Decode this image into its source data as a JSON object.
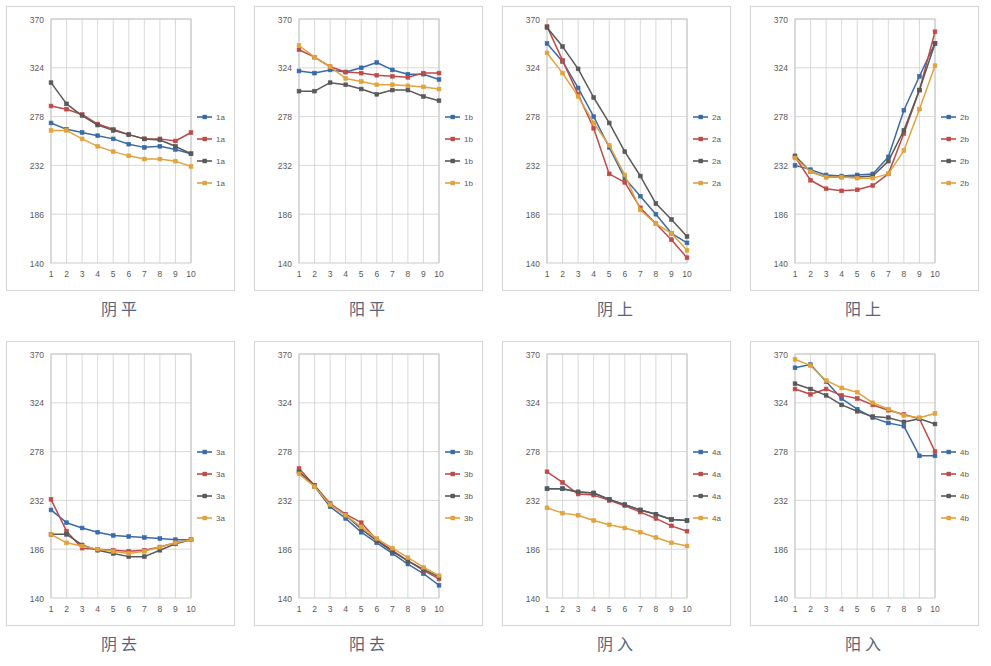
{
  "figure": {
    "panel_count": 8,
    "axis": {
      "y_ticks": [
        140,
        186,
        232,
        278,
        324,
        370
      ],
      "y_min": 140,
      "y_max": 370,
      "x_ticks": [
        1,
        2,
        3,
        4,
        5,
        6,
        7,
        8,
        9,
        10
      ],
      "x_min": 1,
      "x_max": 10,
      "grid": "vertical-and-horizontal"
    },
    "colors": {
      "series1": "#3A6BA5",
      "series2": "#BE4B48",
      "series3": "#595959",
      "series4": "#E0A33E",
      "grid": "#c9c9c9",
      "frame": "#bfbfbf",
      "tick_text": "#595959",
      "caption_text": "#59637a"
    },
    "legend_position": "right"
  },
  "chart_data": [
    {
      "id": "yinping",
      "type": "line",
      "title": "阴平",
      "xlabel": "",
      "ylabel": "",
      "x": [
        1,
        2,
        3,
        4,
        5,
        6,
        7,
        8,
        9,
        10
      ],
      "ylim": [
        140,
        370
      ],
      "legend": [
        "1a",
        "1a",
        "1a",
        "1a"
      ],
      "series": [
        {
          "name": "1a",
          "color": "#3A6BA5",
          "values": [
            272,
            266,
            263,
            260,
            257,
            252,
            249,
            250,
            247,
            243
          ]
        },
        {
          "name": "1a",
          "color": "#BE4B48",
          "values": [
            288,
            285,
            280,
            271,
            266,
            261,
            257,
            257,
            255,
            263
          ]
        },
        {
          "name": "1a",
          "color": "#595959",
          "values": [
            310,
            290,
            279,
            270,
            265,
            261,
            257,
            256,
            250,
            243
          ]
        },
        {
          "name": "1a",
          "color": "#E0A33E",
          "values": [
            265,
            265,
            257,
            250,
            245,
            241,
            238,
            238,
            236,
            231
          ]
        }
      ]
    },
    {
      "id": "yangping",
      "type": "line",
      "title": "阳平",
      "xlabel": "",
      "ylabel": "",
      "x": [
        1,
        2,
        3,
        4,
        5,
        6,
        7,
        8,
        9,
        10
      ],
      "ylim": [
        140,
        370
      ],
      "legend": [
        "1b",
        "1b",
        "1b",
        "1b"
      ],
      "series": [
        {
          "name": "1b",
          "color": "#3A6BA5",
          "values": [
            321,
            319,
            322,
            320,
            324,
            329,
            322,
            318,
            318,
            313
          ]
        },
        {
          "name": "1b",
          "color": "#BE4B48",
          "values": [
            341,
            334,
            325,
            320,
            319,
            317,
            316,
            315,
            319,
            319
          ]
        },
        {
          "name": "1b",
          "color": "#595959",
          "values": [
            302,
            302,
            310,
            308,
            304,
            299,
            303,
            303,
            297,
            293
          ]
        },
        {
          "name": "1b",
          "color": "#E0A33E",
          "values": [
            345,
            334,
            325,
            314,
            311,
            308,
            308,
            307,
            306,
            304
          ]
        }
      ]
    },
    {
      "id": "yinshang",
      "type": "line",
      "title": "阴上",
      "xlabel": "",
      "ylabel": "",
      "x": [
        1,
        2,
        3,
        4,
        5,
        6,
        7,
        8,
        9,
        10
      ],
      "ylim": [
        140,
        370
      ],
      "legend": [
        "2a",
        "2a",
        "2a",
        "2a"
      ],
      "series": [
        {
          "name": "2a",
          "color": "#3A6BA5",
          "values": [
            347,
            330,
            305,
            278,
            249,
            220,
            203,
            186,
            168,
            159
          ]
        },
        {
          "name": "2a",
          "color": "#BE4B48",
          "values": [
            363,
            331,
            299,
            267,
            224,
            216,
            192,
            177,
            162,
            145
          ]
        },
        {
          "name": "2a",
          "color": "#595959",
          "values": [
            362,
            344,
            323,
            296,
            272,
            245,
            222,
            196,
            181,
            165
          ]
        },
        {
          "name": "2a",
          "color": "#E0A33E",
          "values": [
            338,
            319,
            297,
            272,
            251,
            223,
            190,
            177,
            168,
            152
          ]
        }
      ]
    },
    {
      "id": "yangshang",
      "type": "line",
      "title": "阳上",
      "xlabel": "",
      "ylabel": "",
      "x": [
        1,
        2,
        3,
        4,
        5,
        6,
        7,
        8,
        9,
        10
      ],
      "ylim": [
        140,
        370
      ],
      "legend": [
        "2b",
        "2b",
        "2b",
        "2b"
      ],
      "series": [
        {
          "name": "2b",
          "color": "#3A6BA5",
          "values": [
            232,
            228,
            223,
            222,
            223,
            224,
            240,
            284,
            316,
            347
          ]
        },
        {
          "name": "2b",
          "color": "#BE4B48",
          "values": [
            240,
            218,
            210,
            208,
            209,
            213,
            224,
            262,
            303,
            358
          ]
        },
        {
          "name": "2b",
          "color": "#595959",
          "values": [
            241,
            226,
            221,
            221,
            221,
            222,
            236,
            265,
            303,
            347
          ]
        },
        {
          "name": "2b",
          "color": "#E0A33E",
          "values": [
            239,
            226,
            221,
            221,
            220,
            220,
            224,
            246,
            285,
            326
          ]
        }
      ]
    },
    {
      "id": "yinqu",
      "type": "line",
      "title": "阴去",
      "xlabel": "",
      "ylabel": "",
      "x": [
        1,
        2,
        3,
        4,
        5,
        6,
        7,
        8,
        9,
        10
      ],
      "ylim": [
        140,
        370
      ],
      "legend": [
        "3a",
        "3a",
        "3a",
        "3a"
      ],
      "series": [
        {
          "name": "3a",
          "color": "#3A6BA5",
          "values": [
            223,
            211,
            206,
            202,
            199,
            198,
            197,
            196,
            195,
            195
          ]
        },
        {
          "name": "3a",
          "color": "#BE4B48",
          "values": [
            233,
            203,
            187,
            186,
            185,
            184,
            185,
            188,
            192,
            195
          ]
        },
        {
          "name": "3a",
          "color": "#595959",
          "values": [
            200,
            200,
            190,
            185,
            182,
            179,
            179,
            185,
            191,
            195
          ]
        },
        {
          "name": "3a",
          "color": "#E0A33E",
          "values": [
            200,
            192,
            189,
            186,
            184,
            182,
            184,
            188,
            192,
            195
          ]
        }
      ]
    },
    {
      "id": "yangqu",
      "type": "line",
      "title": "阳去",
      "xlabel": "",
      "ylabel": "",
      "x": [
        1,
        2,
        3,
        4,
        5,
        6,
        7,
        8,
        9,
        10
      ],
      "ylim": [
        140,
        370
      ],
      "legend": [
        "3b",
        "3b",
        "3b",
        "3b"
      ],
      "series": [
        {
          "name": "3b",
          "color": "#3A6BA5",
          "values": [
            259,
            245,
            226,
            215,
            202,
            192,
            182,
            172,
            163,
            152
          ]
        },
        {
          "name": "3b",
          "color": "#BE4B48",
          "values": [
            262,
            246,
            229,
            219,
            211,
            195,
            185,
            175,
            166,
            158
          ]
        },
        {
          "name": "3b",
          "color": "#595959",
          "values": [
            259,
            246,
            228,
            218,
            205,
            194,
            184,
            175,
            167,
            160
          ]
        },
        {
          "name": "3b",
          "color": "#E0A33E",
          "values": [
            257,
            245,
            228,
            218,
            207,
            196,
            187,
            178,
            169,
            161
          ]
        }
      ]
    },
    {
      "id": "yinru",
      "type": "line",
      "title": "阴入",
      "xlabel": "",
      "ylabel": "",
      "x": [
        1,
        2,
        3,
        4,
        5,
        6,
        7,
        8,
        9,
        10
      ],
      "ylim": [
        140,
        370
      ],
      "legend": [
        "4a",
        "4a",
        "4a",
        "4a"
      ],
      "series": [
        {
          "name": "4a",
          "color": "#3A6BA5",
          "values": [
            243,
            243,
            240,
            239,
            233,
            228,
            223,
            219,
            214,
            213
          ]
        },
        {
          "name": "4a",
          "color": "#BE4B48",
          "values": [
            259,
            249,
            238,
            237,
            232,
            227,
            221,
            215,
            208,
            203
          ]
        },
        {
          "name": "4a",
          "color": "#595959",
          "values": [
            243,
            243,
            240,
            239,
            233,
            228,
            223,
            219,
            214,
            213
          ]
        },
        {
          "name": "4a",
          "color": "#E0A33E",
          "values": [
            225,
            220,
            218,
            213,
            209,
            206,
            202,
            197,
            192,
            189
          ]
        }
      ]
    },
    {
      "id": "yangru",
      "type": "line",
      "title": "阳入",
      "xlabel": "",
      "ylabel": "",
      "x": [
        1,
        2,
        3,
        4,
        5,
        6,
        7,
        8,
        9,
        10
      ],
      "ylim": [
        140,
        370
      ],
      "legend": [
        "4b",
        "4b",
        "4b",
        "4b"
      ],
      "series": [
        {
          "name": "4b",
          "color": "#3A6BA5",
          "values": [
            357,
            360,
            344,
            328,
            318,
            310,
            305,
            302,
            274,
            274
          ]
        },
        {
          "name": "4b",
          "color": "#BE4B48",
          "values": [
            337,
            332,
            337,
            331,
            328,
            322,
            317,
            313,
            309,
            278
          ]
        },
        {
          "name": "4b",
          "color": "#595959",
          "values": [
            342,
            337,
            331,
            322,
            316,
            311,
            310,
            306,
            309,
            304
          ]
        },
        {
          "name": "4b",
          "color": "#E0A33E",
          "values": [
            365,
            359,
            345,
            338,
            334,
            324,
            318,
            312,
            310,
            314
          ]
        }
      ]
    }
  ],
  "layout": {
    "panels": [
      {
        "id": "yinping",
        "left": 6,
        "top": 6,
        "cap_top": 296
      },
      {
        "id": "yangping",
        "left": 254,
        "top": 6,
        "cap_top": 296
      },
      {
        "id": "yinshang",
        "left": 502,
        "top": 6,
        "cap_top": 296
      },
      {
        "id": "yangshang",
        "left": 750,
        "top": 6,
        "cap_top": 296
      },
      {
        "id": "yinqu",
        "left": 6,
        "top": 341,
        "cap_top": 631
      },
      {
        "id": "yangqu",
        "left": 254,
        "top": 341,
        "cap_top": 631
      },
      {
        "id": "yinru",
        "left": 502,
        "top": 341,
        "cap_top": 631
      },
      {
        "id": "yangru",
        "left": 750,
        "top": 341,
        "cap_top": 631
      }
    ]
  }
}
